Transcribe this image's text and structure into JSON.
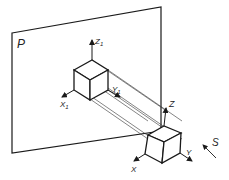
{
  "diagram": {
    "type": "oblique-parallel-projection",
    "plane_label": "P",
    "direction_label": "S",
    "object_axes": {
      "x": "X",
      "y": "Y",
      "z": "Z"
    },
    "projected_axes": {
      "x": "X",
      "y": "Y",
      "z": "Z",
      "subscript": "1"
    },
    "colors": {
      "line": "#1a1a1a",
      "projector": "#333333",
      "background": "#ffffff"
    }
  }
}
